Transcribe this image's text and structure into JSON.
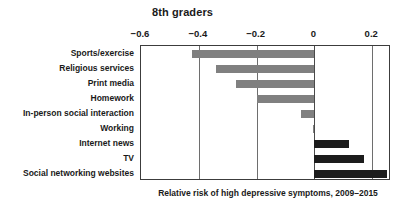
{
  "chart_data": {
    "type": "bar",
    "orientation": "horizontal",
    "title": "8th graders",
    "caption": "Relative risk of high depressive symptoms, 2009–2015",
    "xlabel": "",
    "ylabel": "",
    "xlim": [
      -0.6,
      0.265
    ],
    "xticks": [
      -0.6,
      -0.4,
      -0.2,
      0,
      0.2
    ],
    "xticklabels": [
      "−0.6",
      "−0.4",
      "−0.2",
      "0",
      "0.2"
    ],
    "axis_position": "top",
    "grid": true,
    "legend": "none",
    "zero_reference_line": 0,
    "categories": [
      "Sports/exercise",
      "Religious services",
      "Print media",
      "Homework",
      "In-person social interaction",
      "Working",
      "Internet news",
      "TV",
      "Social networking websites"
    ],
    "values": [
      -0.425,
      -0.34,
      -0.27,
      -0.2,
      -0.045,
      -0.005,
      0.12,
      0.17,
      0.25
    ],
    "bar_colors": [
      "#808080",
      "#808080",
      "#808080",
      "#808080",
      "#808080",
      "#808080",
      "#1c1c1c",
      "#1c1c1c",
      "#1c1c1c"
    ],
    "color_negative": "#808080",
    "color_positive": "#1c1c1c"
  }
}
